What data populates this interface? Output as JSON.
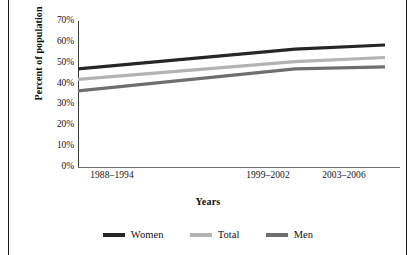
{
  "figure": {
    "border_color": "#1a1a1a"
  },
  "chart_data": {
    "type": "line",
    "title": "",
    "xlabel": "Years",
    "ylabel": "Percent of population",
    "categories": [
      "1988–1994",
      "1999–2002",
      "2003–2006"
    ],
    "x_tick_labels": [
      "1988–1994",
      "1999–2002",
      "2003–2006"
    ],
    "y_tick_labels": [
      "70%",
      "60%",
      "50%",
      "40%",
      "30%",
      "20%",
      "10%",
      "0%"
    ],
    "y_ticks": [
      70,
      60,
      50,
      40,
      30,
      20,
      10,
      0
    ],
    "ylim": [
      0,
      70
    ],
    "grid": false,
    "legend_position": "bottom",
    "series": [
      {
        "name": "Women",
        "color": "#262626",
        "values": [
          47.0,
          56.5,
          58.5
        ]
      },
      {
        "name": "Total",
        "color": "#b3b3b3",
        "values": [
          42.0,
          50.5,
          52.5
        ]
      },
      {
        "name": "Men",
        "color": "#6f6f6f",
        "values": [
          36.5,
          47.0,
          48.0
        ]
      }
    ]
  },
  "legend": {
    "items": [
      {
        "label": "Women",
        "color": "#262626"
      },
      {
        "label": "Total",
        "color": "#b3b3b3"
      },
      {
        "label": "Men",
        "color": "#6f6f6f"
      }
    ]
  }
}
